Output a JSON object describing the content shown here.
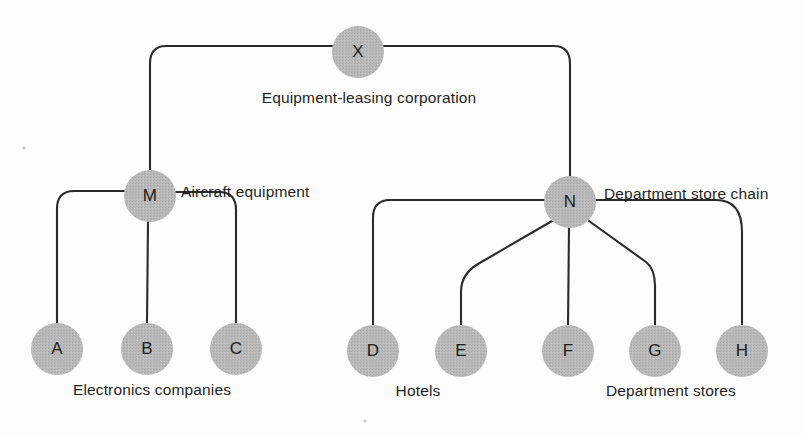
{
  "diagram": {
    "background_color": "#fdfdfd",
    "node_fill_color": "#b9b9b9",
    "edge_color": "#2b2b2b",
    "text_color": "#1f1f1f",
    "node_radius": 26,
    "nodes": [
      {
        "id": "X",
        "letter": "X",
        "cx": 358,
        "cy": 52,
        "level": 0
      },
      {
        "id": "M",
        "letter": "M",
        "cx": 150,
        "cy": 196,
        "level": 1
      },
      {
        "id": "N",
        "letter": "N",
        "cx": 570,
        "cy": 202,
        "level": 1
      },
      {
        "id": "A",
        "letter": "A",
        "cx": 57,
        "cy": 349,
        "level": 2
      },
      {
        "id": "B",
        "letter": "B",
        "cx": 147,
        "cy": 349,
        "level": 2
      },
      {
        "id": "C",
        "letter": "C",
        "cx": 236,
        "cy": 349,
        "level": 2
      },
      {
        "id": "D",
        "letter": "D",
        "cx": 373,
        "cy": 351,
        "level": 2
      },
      {
        "id": "E",
        "letter": "E",
        "cx": 461,
        "cy": 351,
        "level": 2
      },
      {
        "id": "F",
        "letter": "F",
        "cx": 568,
        "cy": 351,
        "level": 2
      },
      {
        "id": "G",
        "letter": "G",
        "cx": 655,
        "cy": 351,
        "level": 2
      },
      {
        "id": "H",
        "letter": "H",
        "cx": 742,
        "cy": 351,
        "level": 2
      }
    ],
    "edges": [
      {
        "id": "x-m",
        "from": "X",
        "to": "M",
        "path": "M 332 46 L 166 46 Q 150 46 150 64 L 150 170"
      },
      {
        "id": "x-n",
        "from": "X",
        "to": "N",
        "path": "M 384 46 L 554 46 Q 570 46 570 64 L 570 176"
      },
      {
        "id": "m-a",
        "from": "M",
        "to": "A",
        "path": "M 124 191 L 74 191 Q 57 191 57 209 L 57 323"
      },
      {
        "id": "m-b",
        "from": "M",
        "to": "B",
        "path": "M 148 222 L 147 323"
      },
      {
        "id": "m-c",
        "from": "M",
        "to": "C",
        "path": "M 176 192 L 219 192 Q 236 192 236 210 L 236 323"
      },
      {
        "id": "n-d",
        "from": "N",
        "to": "D",
        "path": "M 544 200 L 390 200 Q 373 200 373 218 L 373 325"
      },
      {
        "id": "n-e",
        "from": "N",
        "to": "E",
        "path": "M 552 221 L 478 264 Q 461 274 461 292 L 461 325"
      },
      {
        "id": "n-f",
        "from": "N",
        "to": "F",
        "path": "M 569 228 L 568 325"
      },
      {
        "id": "n-g",
        "from": "N",
        "to": "G",
        "path": "M 589 221 L 646 262 Q 655 269 655 286 L 655 325"
      },
      {
        "id": "n-h",
        "from": "N",
        "to": "H",
        "path": "M 596 200 L 716 200 Q 742 200 742 232 L 742 325"
      }
    ],
    "labels": [
      {
        "id": "label-x",
        "text": "Equipment-leasing corporation",
        "x": 369,
        "y": 103,
        "anchor": "middle"
      },
      {
        "id": "label-m",
        "text": "Aircraft equipment",
        "x": 181,
        "y": 197,
        "anchor": "start"
      },
      {
        "id": "label-n",
        "text": "Department store chain",
        "x": 604,
        "y": 199,
        "anchor": "start"
      },
      {
        "id": "label-abc",
        "text": "Electronics companies",
        "x": 152,
        "y": 395,
        "anchor": "middle"
      },
      {
        "id": "label-de",
        "text": "Hotels",
        "x": 418,
        "y": 396,
        "anchor": "middle"
      },
      {
        "id": "label-fgh",
        "text": "Department stores",
        "x": 671,
        "y": 396,
        "anchor": "middle"
      }
    ]
  }
}
